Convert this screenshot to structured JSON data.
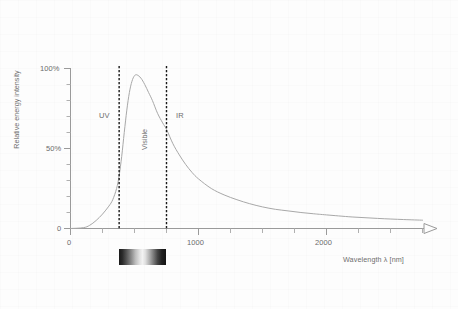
{
  "chart_data": {
    "type": "line",
    "title": "",
    "xlabel": "Wavelength λ [nm]",
    "ylabel": "Relative energy intensity",
    "xlim": [
      0,
      2750
    ],
    "ylim": [
      0,
      100
    ],
    "grid": false,
    "legend_position": "none",
    "x_tick_labels": [
      "0",
      "1000",
      "2000"
    ],
    "x_tick_values": [
      0,
      1000,
      2000
    ],
    "x_minor_tick_step": 250,
    "y_tick_labels": [
      "0",
      "50%",
      "100%"
    ],
    "y_tick_values": [
      0,
      50,
      100
    ],
    "y_minor_tick_step": 10,
    "series": [
      {
        "name": "Relative energy intensity",
        "color": "#a8a8a8",
        "x": [
          0,
          100,
          150,
          200,
          250,
          300,
          330,
          360,
          380,
          400,
          420,
          440,
          460,
          480,
          500,
          520,
          550,
          580,
          610,
          640,
          680,
          720,
          750,
          800,
          850,
          900,
          950,
          1000,
          1100,
          1200,
          1300,
          1400,
          1500,
          1600,
          1700,
          1800,
          1900,
          2000,
          2200,
          2400,
          2600,
          2750
        ],
        "y": [
          0,
          0.5,
          2,
          5,
          9,
          14,
          18,
          25,
          33,
          45,
          60,
          74,
          85,
          92,
          95.5,
          96,
          94,
          90,
          85,
          80,
          72,
          66,
          62,
          53,
          46,
          40,
          35,
          31,
          25,
          21,
          18,
          15.5,
          13.5,
          12,
          11,
          10,
          9.2,
          8.5,
          7.2,
          6.3,
          5.6,
          5.2
        ]
      }
    ],
    "annotations": [
      {
        "name": "uv-region-label",
        "text": "UV",
        "x": 250,
        "y": 62,
        "rotation": 0
      },
      {
        "name": "visible-region-label",
        "text": "Visible",
        "x": 560,
        "y": 40,
        "rotation": -90
      },
      {
        "name": "ir-region-label",
        "text": "IR",
        "x": 1000,
        "y": 62,
        "rotation": 0
      }
    ],
    "vertical_markers": [
      {
        "name": "uv-visible-boundary",
        "x": 380,
        "style": "dashed",
        "color": "#1a1a1a"
      },
      {
        "name": "visible-ir-boundary",
        "x": 750,
        "style": "dashed",
        "color": "#1a1a1a"
      }
    ],
    "spectrum_bar": {
      "name": "visible-spectrum-bar",
      "x_start": 380,
      "x_end": 750,
      "rendered_as": "grayscale-gradient"
    },
    "axis_arrow": {
      "axis": "x",
      "style": "open-triangle"
    }
  },
  "axes": {
    "y_title": "Relative energy intensity",
    "x_title": "Wavelength λ [nm]",
    "y_labels": {
      "zero": "0",
      "mid": "50%",
      "top": "100%"
    },
    "x_labels": {
      "zero": "0",
      "one_thousand": "1000",
      "two_thousand": "2000"
    }
  },
  "regions": {
    "uv": "UV",
    "visible": "Visible",
    "ir": "IR"
  },
  "colors": {
    "curve": "#a8a8a8",
    "axis": "#9a9a9a",
    "text": "#6e6e6e",
    "marker": "#1a1a1a",
    "background": "#fdfdfd"
  }
}
